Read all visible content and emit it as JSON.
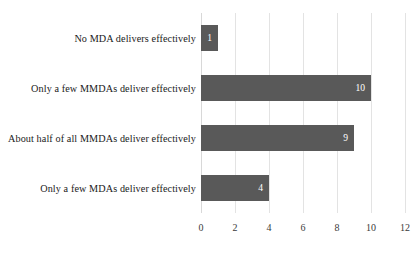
{
  "chart_data": {
    "type": "bar",
    "orientation": "horizontal",
    "title": "",
    "subtitle": "",
    "xlabel": "",
    "ylabel": "",
    "categories": [
      "No MDA delivers effectively",
      "Only a few MMDAs deliver effectively",
      "About half of all MMDAs deliver effectively",
      "Only a few MDAs deliver effectively"
    ],
    "values": [
      1,
      10,
      9,
      4
    ],
    "data_labels": [
      "1",
      "10",
      "9",
      "4"
    ],
    "xlim": [
      0,
      12
    ],
    "xticks": [
      0,
      2,
      4,
      6,
      8,
      10,
      12
    ],
    "xtick_labels": [
      "0",
      "2",
      "4",
      "6",
      "8",
      "10",
      "12"
    ],
    "grid": "vertical",
    "legend": "none",
    "bar_color": "#595959",
    "data_label_color": "#ffffff",
    "gridline_color": "#e3e3e3",
    "background_color": "#ffffff"
  }
}
